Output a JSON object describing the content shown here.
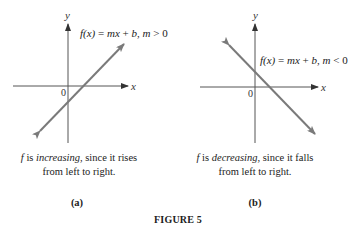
{
  "figure": {
    "title": "FIGURE 5"
  },
  "panels": [
    {
      "id": "a",
      "panel_label": "(a)",
      "axis_x_label": "x",
      "axis_y_label": "y",
      "origin_label": "0",
      "function_label": {
        "fx": "f(x)",
        "eq": " = ",
        "m1": "mx",
        "plus": " + ",
        "b": "b",
        "comma": ", ",
        "m2": "m",
        "cond": " > 0"
      },
      "caption": {
        "f": "f",
        "is": " is ",
        "term": "increasing",
        "rest1": ", since it rises",
        "line2": "from left to right."
      },
      "line": {
        "x1": 40,
        "y1": 131,
        "x2": 124,
        "y2": 44,
        "direction": "rising"
      }
    },
    {
      "id": "b",
      "panel_label": "(b)",
      "axis_x_label": "x",
      "axis_y_label": "y",
      "origin_label": "0",
      "function_label": {
        "fx": "f(x)",
        "eq": " = ",
        "m1": "mx",
        "plus": " + ",
        "b": "b",
        "comma": ", ",
        "m2": "m",
        "cond": " < 0"
      },
      "caption": {
        "f": "f",
        "is": " is ",
        "term": "decreasing",
        "rest1": ", since it falls",
        "line2": "from left to right."
      },
      "line": {
        "x1": 229,
        "y1": 45,
        "x2": 315,
        "y2": 134,
        "direction": "falling"
      }
    }
  ],
  "colors": {
    "axis": "#555555",
    "line": "#7a7a7a",
    "text": "#222222"
  }
}
